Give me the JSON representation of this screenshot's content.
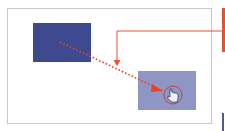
{
  "diagram": {
    "source_rect": {
      "color": "#3d4a8f",
      "state": "original position"
    },
    "target_rect": {
      "color": "#8f96c3",
      "state": "dragged ghost position"
    },
    "cursor": {
      "icon": "hand-pointer-icon",
      "highlight_color": "#c94a4a"
    },
    "drag_path": {
      "style": "dotted",
      "color": "#e8412a"
    },
    "callout_line": {
      "color": "#e8512f"
    },
    "accent_colors": {
      "red": "#e8412a",
      "border": "#c8c8cc"
    }
  }
}
